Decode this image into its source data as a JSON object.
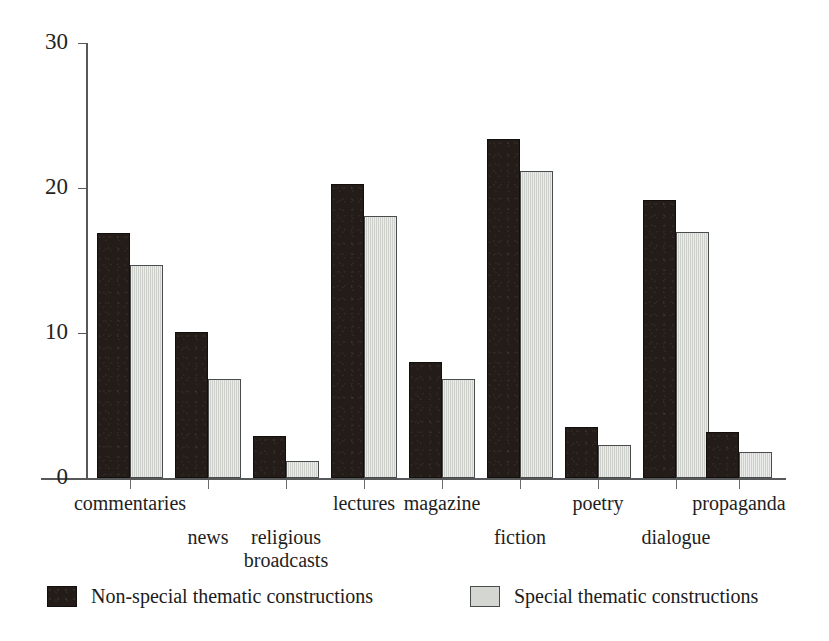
{
  "chart_data": {
    "type": "bar",
    "title": "",
    "xlabel": "",
    "ylabel": "",
    "ylim": [
      0,
      30
    ],
    "yticks": [
      0,
      10,
      20,
      30
    ],
    "grid": false,
    "legend_position": "bottom",
    "categories": [
      "commentaries",
      "news",
      "religious\nbroadcasts",
      "lectures",
      "magazine",
      "fiction",
      "poetry",
      "dialogue",
      "propaganda"
    ],
    "series": [
      {
        "name": "Non-special thematic constructions",
        "color": "#231c18",
        "values": [
          16.9,
          10.1,
          2.9,
          20.3,
          8.0,
          23.4,
          3.5,
          19.2,
          3.2
        ]
      },
      {
        "name": "Special thematic constructions",
        "color": "#d4d7d1",
        "values": [
          14.7,
          6.8,
          1.2,
          18.1,
          6.8,
          21.2,
          2.3,
          17.0,
          1.8
        ]
      }
    ]
  },
  "axis": {
    "y_tick_labels": [
      "0",
      "10",
      "20",
      "30"
    ]
  },
  "legend": {
    "entries": [
      {
        "label": "Non-special thematic constructions",
        "swatch": "dark-swatch"
      },
      {
        "label": "Special thematic constructions",
        "swatch": "light-swatch"
      }
    ]
  },
  "category_label_rows": [
    {
      "text": "commentaries",
      "row": 0
    },
    {
      "text": "news",
      "row": 1
    },
    {
      "text": "religious\nbroadcasts",
      "row": 1
    },
    {
      "text": "lectures",
      "row": 0
    },
    {
      "text": "magazine",
      "row": 0
    },
    {
      "text": "fiction",
      "row": 1
    },
    {
      "text": "poetry",
      "row": 0
    },
    {
      "text": "dialogue",
      "row": 1
    },
    {
      "text": "propaganda",
      "row": 0
    }
  ]
}
